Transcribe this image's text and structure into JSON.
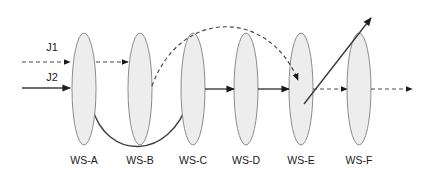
{
  "diagram": {
    "type": "flowshop-routing-diagram",
    "width": 426,
    "height": 178,
    "background_color": "#ffffff",
    "machine_fill_color": "#ededed",
    "machine_stroke_color": "#8c8c8c",
    "arrow_color": "#1a1a1a",
    "workstations": [
      {
        "id": "ws-a",
        "label": "WS-A",
        "cx": 84,
        "cy": 89,
        "rx": 12,
        "ry": 56,
        "label_x": 84,
        "label_y": 161
      },
      {
        "id": "ws-b",
        "label": "WS-B",
        "cx": 140,
        "cy": 89,
        "rx": 12,
        "ry": 56,
        "label_x": 140,
        "label_y": 161
      },
      {
        "id": "ws-c",
        "label": "WS-C",
        "cx": 193,
        "cy": 89,
        "rx": 12,
        "ry": 56,
        "label_x": 193,
        "label_y": 161
      },
      {
        "id": "ws-d",
        "label": "WS-D",
        "cx": 246,
        "cy": 89,
        "rx": 12,
        "ry": 56,
        "label_x": 246,
        "label_y": 161
      },
      {
        "id": "ws-e",
        "label": "WS-E",
        "cx": 301,
        "cy": 89,
        "rx": 12,
        "ry": 56,
        "label_x": 301,
        "label_y": 161
      },
      {
        "id": "ws-f",
        "label": "WS-F",
        "cx": 359,
        "cy": 89,
        "rx": 12,
        "ry": 56,
        "label_x": 359,
        "label_y": 161
      }
    ],
    "jobs": [
      {
        "id": "j1",
        "label": "J1",
        "style": "dashed",
        "label_x": 52,
        "label_y": 48
      },
      {
        "id": "j2",
        "label": "J2",
        "style": "solid",
        "label_x": 52,
        "label_y": 78
      }
    ],
    "routes": {
      "j1_entry": {
        "style": "dashed",
        "from": "entry",
        "to": "ws-a",
        "path": "M 22 62 L 70 62"
      },
      "j1_a_to_b": {
        "style": "dashed",
        "from": "ws-a",
        "to": "ws-b",
        "path": "M 96 62 L 128 62"
      },
      "j1_b_to_e": {
        "style": "dashed",
        "from": "ws-b",
        "to": "ws-e",
        "path": "M 152 86 C 180 8 268 8 298 80"
      },
      "j1_e_to_f": {
        "style": "dashed",
        "from": "ws-e",
        "to": "ws-f",
        "path": "M 313 89 L 347 89"
      },
      "j1_f_exit": {
        "style": "dashed",
        "from": "ws-f",
        "to": "exit",
        "path": "M 371 89 L 412 89"
      },
      "j2_entry": {
        "style": "solid",
        "from": "entry",
        "to": "ws-a",
        "path": "M 22 88 L 70 88"
      },
      "j2_a_to_c": {
        "style": "solid",
        "from": "ws-a",
        "to": "ws-c",
        "path": "M 92 107 C 106 160 170 162 189 99"
      },
      "j2_c_to_d": {
        "style": "solid",
        "from": "ws-c",
        "to": "ws-d",
        "path": "M 205 89 L 234 89"
      },
      "j2_d_to_e": {
        "style": "solid",
        "from": "ws-d",
        "to": "ws-e",
        "path": "M 258 89 L 289 89"
      },
      "j2_e_exit": {
        "style": "solid",
        "from": "ws-e",
        "to": "exit",
        "path": "M 304 104 L 371 18"
      }
    }
  }
}
